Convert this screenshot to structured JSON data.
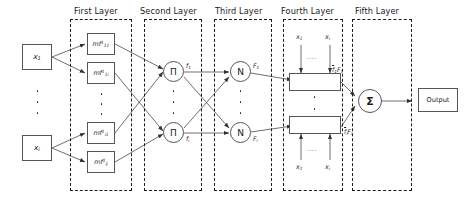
{
  "diagram": {
    "type": "neural-network-architecture"
  },
  "layer_titles": [
    {
      "id": "first",
      "label": "First Layer"
    },
    {
      "id": "second",
      "label": "Second Layer"
    },
    {
      "id": "third",
      "label": "Third Layer"
    },
    {
      "id": "fourth",
      "label": "Fourth  Layer"
    },
    {
      "id": "fifth",
      "label": "Fifth Layer"
    }
  ],
  "inputs": [
    {
      "id": "x1",
      "label_html": "x<sub>1</sub>"
    },
    {
      "id": "xi",
      "label_html": "x<sub>i</sub>"
    }
  ],
  "input_dots": "vertical-ellipsis",
  "membership_nodes": [
    {
      "id": "mf11",
      "label_html": "mf<sup>1</sup><sub>11</sub>"
    },
    {
      "id": "mf1i",
      "label_html": "mf<sup>1</sup><sub>1i</sub>"
    },
    {
      "id": "mfi1",
      "label_html": "mf<sup>1</sup><sub>i1</sub>"
    },
    {
      "id": "mfij",
      "label_html": "mf<sup>1</sup><sub>ij</sub>"
    }
  ],
  "product_nodes": [
    {
      "id": "pi-top",
      "glyph": "Π",
      "out_label_html": "f<sub>1</sub>"
    },
    {
      "id": "pi-bottom",
      "glyph": "Π",
      "out_label_html": "f<sub>i</sub>"
    }
  ],
  "normalize_nodes": [
    {
      "id": "n-top",
      "glyph": "N",
      "out_label_html": "F<sub>1</sub>"
    },
    {
      "id": "n-bottom",
      "glyph": "N",
      "out_label_html": "F<sub>i</sub>"
    }
  ],
  "defuzz_nodes": [
    {
      "id": "defuzz-top",
      "out_label_html": "<span class=\"ovl\">f</span><sub>1</sub>F<sub>1</sub>",
      "feed_labels": [
        {
          "id": "top-x1",
          "label_html": "x<sub>1</sub>"
        },
        {
          "id": "top-xi",
          "label_html": "x<sub>i</sub>"
        }
      ],
      "feed_dots": "...."
    },
    {
      "id": "defuzz-bottom",
      "out_label_html": "<span class=\"ovl\">f</span><sub>i</sub>F<sub>i</sub>",
      "feed_labels": [
        {
          "id": "bot-x1",
          "label_html": "x<sub>1</sub>"
        },
        {
          "id": "bot-xi",
          "label_html": "x<sub>i</sub>"
        }
      ],
      "feed_dots": "...."
    }
  ],
  "sum_node": {
    "id": "sigma",
    "glyph": "Σ"
  },
  "output": {
    "id": "output",
    "label": "Output"
  },
  "colors": {
    "stroke": "#555555",
    "dashed_border": "#1a1a1a",
    "text": "#1a1a1a",
    "background": "#ffffff"
  }
}
